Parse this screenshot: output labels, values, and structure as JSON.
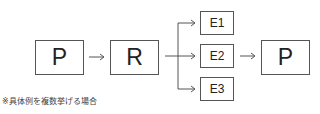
{
  "diagram": {
    "nodes": {
      "p_start": {
        "label": "P"
      },
      "r": {
        "label": "R"
      },
      "e1": {
        "label": "E1"
      },
      "e2": {
        "label": "E2"
      },
      "e3": {
        "label": "E3"
      },
      "p_end": {
        "label": "P"
      }
    },
    "edges": [
      {
        "from": "P",
        "to": "R"
      },
      {
        "from": "R",
        "to": "E1"
      },
      {
        "from": "R",
        "to": "E2"
      },
      {
        "from": "R",
        "to": "E3"
      },
      {
        "from": "E2",
        "to": "P"
      }
    ],
    "note": "※具体例を複数挙げる場合",
    "colors": {
      "stroke": "#555555",
      "text": "#222222",
      "background": "#ffffff"
    }
  }
}
